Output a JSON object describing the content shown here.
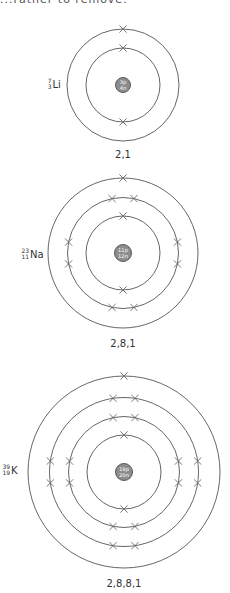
{
  "page": {
    "cropped_heading": "...rather to remove."
  },
  "atoms": [
    {
      "id": "lithium",
      "symbol": "Li",
      "mass_number": "7",
      "atomic_number": "3",
      "nucleus": {
        "protons": "3p",
        "neutrons": "4n"
      },
      "configuration": "2,1",
      "shells": [
        2,
        1
      ],
      "geometry": {
        "cx": 123,
        "cy": 85,
        "radii": [
          37,
          56
        ],
        "nucleus_r": 7.5,
        "label_x": 48,
        "label_y": 86,
        "config_y": 158
      }
    },
    {
      "id": "sodium",
      "symbol": "Na",
      "mass_number": "23",
      "atomic_number": "11",
      "nucleus": {
        "protons": "11p",
        "neutrons": "12n"
      },
      "configuration": "2,8,1",
      "shells": [
        2,
        8,
        1
      ],
      "geometry": {
        "cx": 123,
        "cy": 253,
        "radii": [
          37,
          55.5,
          75
        ],
        "nucleus_r": 8.5,
        "label_x": 22,
        "label_y": 256,
        "config_y": 347
      }
    },
    {
      "id": "potassium",
      "symbol": "K",
      "mass_number": "39",
      "atomic_number": "19",
      "nucleus": {
        "protons": "19p",
        "neutrons": "20n"
      },
      "configuration": "2,8,8,1",
      "shells": [
        2,
        8,
        8,
        1
      ],
      "geometry": {
        "cx": 124,
        "cy": 472,
        "radii": [
          37,
          55.5,
          74.5,
          96
        ],
        "nucleus_r": 8.5,
        "label_x": 3,
        "label_y": 472,
        "config_y": 587
      }
    }
  ],
  "colors": {
    "shell_stroke": "#555555",
    "nucleus_fill": "#8c8c8c",
    "electron_stroke": "#6a6a6a",
    "text": "#333333"
  }
}
